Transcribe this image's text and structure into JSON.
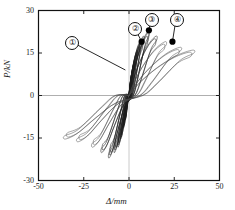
{
  "chart_data": {
    "type": "line",
    "title": "",
    "subtitle": "",
    "xlabel": "Δ/mm",
    "ylabel": "P/kN",
    "xlim": [
      -50,
      50
    ],
    "ylim": [
      -30,
      30
    ],
    "xticks": [
      -50,
      -25,
      0,
      25,
      50
    ],
    "yticks": [
      -30,
      -15,
      0,
      15,
      30
    ],
    "xtick_labels": [
      "-50",
      "-25",
      "0",
      "25",
      "50"
    ],
    "ytick_labels": [
      "-30",
      "-15",
      "0",
      "15",
      "30"
    ],
    "grid": false,
    "legend": null,
    "annotations": [
      {
        "label": "①",
        "circle_xy": [
          -32,
          19
        ],
        "point_xy": [
          -2,
          9
        ],
        "has_dot": false,
        "leader": true
      },
      {
        "label": "②",
        "circle_xy": [
          3,
          24
        ],
        "point_xy": [
          7,
          19
        ],
        "has_dot": true,
        "leader": true
      },
      {
        "label": "③",
        "circle_xy": [
          12,
          27
        ],
        "point_xy": [
          11,
          23
        ],
        "has_dot": true,
        "leader": true
      },
      {
        "label": "④",
        "circle_xy": [
          26,
          27
        ],
        "point_xy": [
          24,
          19
        ],
        "has_dot": true,
        "leader": true
      }
    ],
    "loops": [
      {
        "name": "cycle-1",
        "peak_disp": 2.0,
        "peak_load": 9.0
      },
      {
        "name": "cycle-2",
        "peak_disp": 3.0,
        "peak_load": 12.0
      },
      {
        "name": "cycle-3",
        "peak_disp": 4.5,
        "peak_load": 16.0
      },
      {
        "name": "cycle-4",
        "peak_disp": 6.0,
        "peak_load": 19.0
      },
      {
        "name": "cycle-5",
        "peak_disp": 8.0,
        "peak_load": 21.0
      },
      {
        "name": "cycle-6",
        "peak_disp": 11.0,
        "peak_load": 23.0
      },
      {
        "name": "cycle-7",
        "peak_disp": 15.0,
        "peak_load": 21.0
      },
      {
        "name": "cycle-8",
        "peak_disp": 20.0,
        "peak_load": 19.0
      },
      {
        "name": "cycle-9",
        "peak_disp": 28.0,
        "peak_load": 17.0
      },
      {
        "name": "cycle-10",
        "peak_disp": 35.0,
        "peak_load": 16.0
      }
    ]
  }
}
